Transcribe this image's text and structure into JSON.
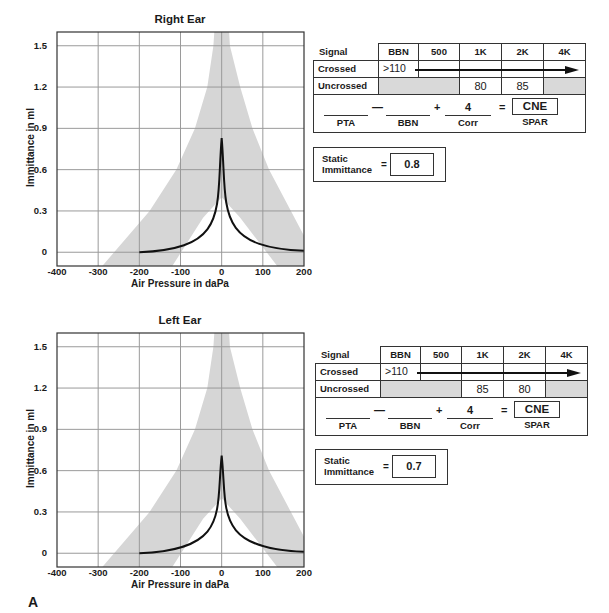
{
  "figure_label": "A",
  "chart_data": [
    {
      "type": "line",
      "title": "Right Ear",
      "xlabel": "Air Pressure in daPa",
      "ylabel": "Immittance in ml",
      "xlim": [
        -400,
        200
      ],
      "ylim": [
        -0.1,
        1.6
      ],
      "x_ticks": [
        "-400",
        "-300",
        "-200",
        "-100",
        "0",
        "100",
        "200"
      ],
      "y_ticks": [
        "1.5",
        "1.2",
        "0.9",
        "0.6",
        "0.3",
        "0"
      ],
      "grid": true,
      "legend": null,
      "series": [
        {
          "name": "tympanogram",
          "x": [
            -200,
            -150,
            -100,
            -50,
            -25,
            -10,
            0,
            10,
            25,
            50,
            100,
            150,
            200
          ],
          "y": [
            0.0,
            0.04,
            0.12,
            0.27,
            0.4,
            0.55,
            0.83,
            0.55,
            0.4,
            0.27,
            0.12,
            0.04,
            0.01
          ]
        }
      ],
      "normal_range_band": {
        "description": "shaded normal region",
        "outer_left": [
          [
            -290,
            -0.1
          ],
          [
            -175,
            0.3
          ],
          [
            -110,
            0.6
          ],
          [
            -65,
            0.9
          ],
          [
            -35,
            1.2
          ],
          [
            -20,
            1.5
          ],
          [
            -18,
            1.6
          ]
        ],
        "inner_left": [
          [
            -120,
            -0.1
          ],
          [
            -45,
            0.25
          ],
          [
            0,
            0.4
          ]
        ],
        "inner_right": [
          [
            0,
            0.4
          ],
          [
            45,
            0.25
          ],
          [
            135,
            -0.1
          ]
        ],
        "outer_right": [
          [
            18,
            1.6
          ],
          [
            20,
            1.5
          ],
          [
            45,
            1.2
          ],
          [
            75,
            0.9
          ],
          [
            115,
            0.6
          ],
          [
            200,
            0.12
          ]
        ]
      }
    },
    {
      "type": "line",
      "title": "Left Ear",
      "xlabel": "Air Pressure in daPa",
      "ylabel": "Immittance in ml",
      "xlim": [
        -400,
        200
      ],
      "ylim": [
        -0.1,
        1.6
      ],
      "x_ticks": [
        "-400",
        "-300",
        "-200",
        "-100",
        "0",
        "100",
        "200"
      ],
      "y_ticks": [
        "1.5",
        "1.2",
        "0.9",
        "0.6",
        "0.3",
        "0"
      ],
      "grid": true,
      "legend": null,
      "series": [
        {
          "name": "tympanogram",
          "x": [
            -200,
            -150,
            -100,
            -50,
            -25,
            -10,
            0,
            10,
            25,
            50,
            100,
            150,
            200
          ],
          "y": [
            0.0,
            0.03,
            0.1,
            0.23,
            0.34,
            0.47,
            0.71,
            0.47,
            0.34,
            0.23,
            0.1,
            0.03,
            0.01
          ]
        }
      ],
      "normal_range_band": {
        "description": "shaded normal region",
        "outer_left": [
          [
            -290,
            -0.1
          ],
          [
            -175,
            0.3
          ],
          [
            -110,
            0.6
          ],
          [
            -65,
            0.9
          ],
          [
            -35,
            1.2
          ],
          [
            -20,
            1.5
          ],
          [
            -18,
            1.6
          ]
        ],
        "inner_left": [
          [
            -120,
            -0.1
          ],
          [
            -45,
            0.25
          ],
          [
            0,
            0.4
          ]
        ],
        "inner_right": [
          [
            0,
            0.4
          ],
          [
            45,
            0.25
          ],
          [
            135,
            -0.1
          ]
        ],
        "outer_right": [
          [
            18,
            1.6
          ],
          [
            20,
            1.5
          ],
          [
            45,
            1.2
          ],
          [
            75,
            0.9
          ],
          [
            115,
            0.6
          ],
          [
            200,
            0.12
          ]
        ]
      }
    }
  ],
  "right_ear": {
    "title": "Right Ear",
    "x_axis_title": "Air Pressure in daPa",
    "y_axis_title": "Immittance in ml",
    "reflex_table": {
      "header_label": "Signal to RE",
      "columns": [
        "BBN",
        "500",
        "1K",
        "2K",
        "4K"
      ],
      "crossed_label": "Crossed",
      "crossed_value": ">110",
      "uncrossed_label": "Uncrossed",
      "uncrossed_values": [
        "",
        "",
        "80",
        "85",
        ""
      ]
    },
    "spar": {
      "pta_label": "PTA",
      "bbn_label": "BBN",
      "corr_label": "Corr",
      "corr_value": "4",
      "spar_label": "SPAR",
      "spar_value": "CNE",
      "minus": "—",
      "plus": "+",
      "equals": "="
    },
    "static": {
      "label_line1": "Static",
      "label_line2": "Immittance",
      "equals": "=",
      "value": "0.8"
    }
  },
  "left_ear": {
    "title": "Left Ear",
    "x_axis_title": "Air Pressure in daPa",
    "y_axis_title": "Immittance in ml",
    "reflex_table": {
      "header_label": "Signal to LE",
      "columns": [
        "BBN",
        "500",
        "1K",
        "2K",
        "4K"
      ],
      "crossed_label": "Crossed",
      "crossed_value": ">110",
      "uncrossed_label": "Uncrossed",
      "uncrossed_values": [
        "",
        "",
        "85",
        "80",
        ""
      ]
    },
    "spar": {
      "pta_label": "PTA",
      "bbn_label": "BBN",
      "corr_label": "Corr",
      "corr_value": "4",
      "spar_label": "SPAR",
      "spar_value": "CNE",
      "minus": "—",
      "plus": "+",
      "equals": "="
    },
    "static": {
      "label_line1": "Static",
      "label_line2": "Immittance",
      "equals": "=",
      "value": "0.7"
    }
  },
  "colors": {
    "band": "#d6d6d6",
    "grid": "#9a9a9a",
    "curve": "#111111",
    "frame": "#333333",
    "gray_cell": "#d9d9d9"
  }
}
